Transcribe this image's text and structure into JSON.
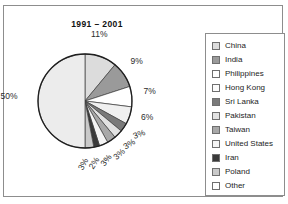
{
  "chart_data": {
    "type": "pie",
    "title": "1991 – 2001",
    "xlabel": "",
    "ylabel": "",
    "legend_position": "right",
    "grid": false,
    "categories": [
      "China",
      "India",
      "Philippines",
      "Hong Kong",
      "Sri Lanka",
      "Pakistan",
      "Taiwan",
      "United States",
      "Iran",
      "Poland",
      "Other"
    ],
    "values": [
      11,
      9,
      7,
      6,
      3,
      3,
      3,
      3,
      2,
      3,
      50
    ],
    "value_labels": [
      "11%",
      "9%",
      "7%",
      "6%",
      "3%",
      "3%",
      "3%",
      "3%",
      "2%",
      "3%",
      "50%"
    ],
    "colors": [
      "#dcdcdc",
      "#9a9a9a",
      "#ffffff",
      "#f0f0f0",
      "#7a7a7a",
      "#e2e2e2",
      "#a8a8a8",
      "#f4f4f4",
      "#3a3a3a",
      "#c9c9c9",
      "#ececec"
    ],
    "slices": [
      {
        "label": "China",
        "value": 11,
        "display": "11%",
        "color": "#dcdcdc"
      },
      {
        "label": "India",
        "value": 9,
        "display": "9%",
        "color": "#9a9a9a"
      },
      {
        "label": "Philippines",
        "value": 7,
        "display": "7%",
        "color": "#ffffff"
      },
      {
        "label": "Hong Kong",
        "value": 6,
        "display": "6%",
        "color": "#f0f0f0"
      },
      {
        "label": "Sri Lanka",
        "value": 3,
        "display": "3%",
        "color": "#7a7a7a"
      },
      {
        "label": "Pakistan",
        "value": 3,
        "display": "3%",
        "color": "#e2e2e2"
      },
      {
        "label": "Taiwan",
        "value": 3,
        "display": "3%",
        "color": "#a8a8a8"
      },
      {
        "label": "United States",
        "value": 3,
        "display": "3%",
        "color": "#f4f4f4"
      },
      {
        "label": "Iran",
        "value": 2,
        "display": "2%",
        "color": "#3a3a3a"
      },
      {
        "label": "Poland",
        "value": 3,
        "display": "3%",
        "color": "#c9c9c9"
      },
      {
        "label": "Other",
        "value": 50,
        "display": "50%",
        "color": "#ececec"
      }
    ]
  },
  "legend": {
    "items": [
      {
        "label": "China",
        "color": "#dcdcdc"
      },
      {
        "label": "India",
        "color": "#9a9a9a"
      },
      {
        "label": "Philippines",
        "color": "#ffffff"
      },
      {
        "label": "Hong Kong",
        "color": "#fbfbfb"
      },
      {
        "label": "Sri Lanka",
        "color": "#7a7a7a"
      },
      {
        "label": "Pakistan",
        "color": "#e2e2e2"
      },
      {
        "label": "Taiwan",
        "color": "#a8a8a8"
      },
      {
        "label": "United States",
        "color": "#f4f4f4"
      },
      {
        "label": "Iran",
        "color": "#3a3a3a"
      },
      {
        "label": "Poland",
        "color": "#c9c9c9"
      },
      {
        "label": "Other",
        "color": "#ffffff"
      }
    ]
  }
}
